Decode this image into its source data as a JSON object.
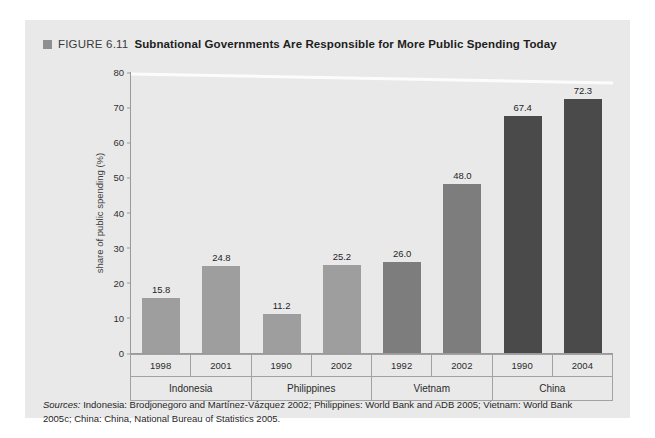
{
  "figure": {
    "marker_icon": "square-marker-icon",
    "label": "FIGURE 6.11",
    "headline": "Subnational Governments Are Responsible for More Public Spending Today",
    "sources_prefix": "Sources:",
    "sources_text": " Indonesia: Brodjonegoro and Martínez-Vázquez 2002; Philippines: World Bank and ADB 2005; Vietnam: World Bank 2005c; China: China, National Bureau of Statistics 2005."
  },
  "colors": {
    "panel_background": "#e9e9e9",
    "bar_light": "#9e9e9e",
    "bar_medium": "#7d7d7d",
    "bar_dark": "#4a4a4a",
    "axis": "#9a9a9a",
    "text": "#1f1f1f"
  },
  "chart_data": {
    "type": "bar",
    "title": "Subnational Governments Are Responsible for More Public Spending Today",
    "xlabel": "",
    "ylabel": "share of public spending (%)",
    "ylim": [
      0,
      80
    ],
    "yticks": [
      0,
      10,
      20,
      30,
      40,
      50,
      60,
      70,
      80
    ],
    "grid": false,
    "legend": "none",
    "categories": [
      "1998",
      "2001",
      "1990",
      "2002",
      "1992",
      "2002",
      "1990",
      "2004"
    ],
    "values": [
      15.8,
      24.8,
      11.2,
      25.2,
      26.0,
      48.0,
      67.4,
      72.3
    ],
    "value_labels": [
      "15.8",
      "24.8",
      "11.2",
      "25.2",
      "26.0",
      "48.0",
      "67.4",
      "72.3"
    ],
    "bar_colors": [
      "#9e9e9e",
      "#9e9e9e",
      "#9e9e9e",
      "#9e9e9e",
      "#7d7d7d",
      "#7d7d7d",
      "#4a4a4a",
      "#4a4a4a"
    ],
    "groups": [
      {
        "label": "Indonesia",
        "span": 2
      },
      {
        "label": "Philippines",
        "span": 2
      },
      {
        "label": "Vietnam",
        "span": 2
      },
      {
        "label": "China",
        "span": 2
      }
    ]
  }
}
